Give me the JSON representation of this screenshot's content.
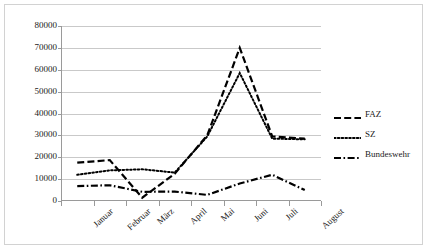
{
  "chart_data": {
    "type": "line",
    "title": "",
    "xlabel": "",
    "ylabel": "",
    "categories": [
      "Januar",
      "Februar",
      "März",
      "April",
      "Mai",
      "Juni",
      "Juli",
      "August"
    ],
    "ylim": [
      0,
      80000
    ],
    "ytick_labels": [
      "80000",
      "70000",
      "60000",
      "50000",
      "40000",
      "30000",
      "20000",
      "10000",
      "0"
    ],
    "ytick_values": [
      80000,
      70000,
      60000,
      50000,
      40000,
      30000,
      20000,
      10000,
      0
    ],
    "grid": true,
    "legend_position": "right",
    "series": [
      {
        "name": "FAZ",
        "style": "dashed",
        "color": "#000000",
        "values": [
          17500,
          18700,
          1500,
          12500,
          30000,
          70000,
          29500,
          28500
        ]
      },
      {
        "name": "SZ",
        "style": "dotted",
        "color": "#000000",
        "values": [
          12000,
          14000,
          14500,
          13000,
          29500,
          58500,
          28500,
          28200
        ]
      },
      {
        "name": "Bundeswehr",
        "style": "dash-dot",
        "color": "#000000",
        "values": [
          6800,
          7200,
          4200,
          4300,
          2800,
          8000,
          12000,
          5000
        ]
      }
    ]
  },
  "legend": {
    "items": [
      {
        "label": "FAZ",
        "swatch": "dashed-line-swatch"
      },
      {
        "label": "SZ",
        "swatch": "dotted-line-swatch"
      },
      {
        "label": "Bundeswehr",
        "swatch": "dash-dot-line-swatch"
      }
    ]
  }
}
